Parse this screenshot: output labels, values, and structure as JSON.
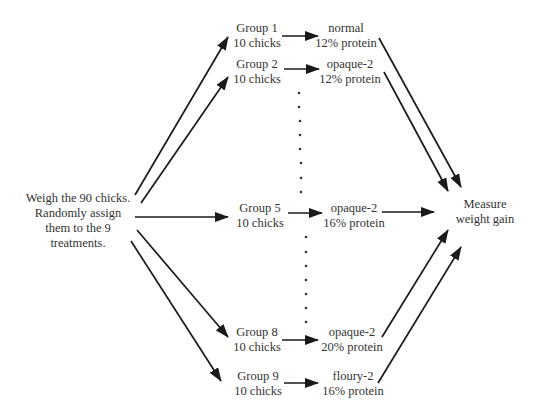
{
  "diagram": {
    "type": "experimental-design-flow",
    "start": {
      "lines": [
        "Weigh the 90 chicks.",
        "Randomly assign",
        "them to the 9",
        "treatments."
      ]
    },
    "groups": [
      {
        "name": "Group 1",
        "size": "10 chicks",
        "treatment_line1": "normal",
        "treatment_line2": "12% protein"
      },
      {
        "name": "Group 2",
        "size": "10 chicks",
        "treatment_line1": "opaque-2",
        "treatment_line2": "12% protein"
      },
      {
        "name": "Group 5",
        "size": "10 chicks",
        "treatment_line1": "opaque-2",
        "treatment_line2": "16% protein"
      },
      {
        "name": "Group 8",
        "size": "10 chicks",
        "treatment_line1": "opaque-2",
        "treatment_line2": "20% protein"
      },
      {
        "name": "Group 9",
        "size": "10 chicks",
        "treatment_line1": "floury-2",
        "treatment_line2": "16% protein"
      }
    ],
    "end": {
      "lines": [
        "Measure",
        "weight gain"
      ]
    },
    "colors": {
      "arrow": "#1a1a1a",
      "text": "#333333",
      "background": "#ffffff"
    }
  }
}
